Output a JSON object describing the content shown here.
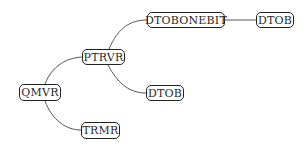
{
  "diagram": {
    "type": "tree",
    "nodes": [
      {
        "id": "qmvr",
        "label": "QMVR"
      },
      {
        "id": "trmr",
        "label": "TRMR"
      },
      {
        "id": "ptrvr",
        "label": "PTRVR"
      },
      {
        "id": "dtob1",
        "label": "DTOB"
      },
      {
        "id": "dtobonebit",
        "label": "DTOBONEBIT"
      },
      {
        "id": "dtob2",
        "label": "DTOB"
      }
    ],
    "edges": [
      {
        "from": "QMVR",
        "to": "PTRVR"
      },
      {
        "from": "QMVR",
        "to": "TRMR"
      },
      {
        "from": "PTRVR",
        "to": "DTOBONEBIT"
      },
      {
        "from": "PTRVR",
        "to": "DTOB"
      },
      {
        "from": "DTOBONEBIT",
        "to": "DTOB"
      }
    ]
  }
}
